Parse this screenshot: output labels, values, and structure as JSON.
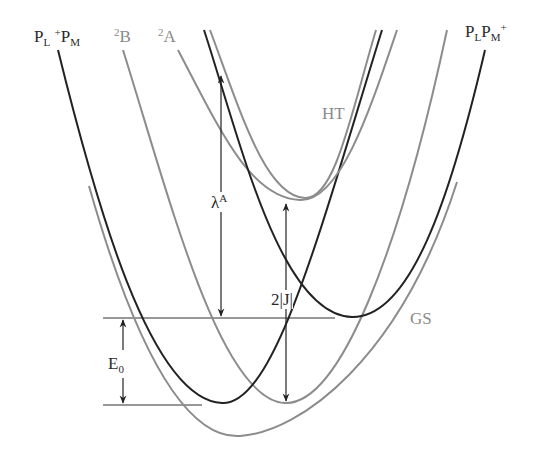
{
  "figure": {
    "labels": {
      "left_top": {
        "base1": "P",
        "sub1": "L",
        "sup": "+",
        "base2": "P",
        "sub2": "M"
      },
      "right_top": {
        "base1": "P",
        "sub1": "L",
        "base2": "P",
        "sub2": "M",
        "sup": "+"
      },
      "state_2B": {
        "sup": "2",
        "base": "B"
      },
      "state_2A": {
        "sup": "2",
        "base": "A"
      },
      "ht": "HT",
      "gs": "GS"
    },
    "arrows": {
      "lambda": {
        "base": "λ",
        "sup": "A"
      },
      "two_j": "2|J|",
      "e0": {
        "base": "E",
        "sub": "0"
      }
    },
    "colors": {
      "dark_curve": "#222222",
      "gray_curve": "#8c8c8c",
      "arrow": "#222222",
      "background": "#ffffff"
    },
    "curves": [
      {
        "name": "PL+PM",
        "style": "dark",
        "min": [
          222,
          403
        ]
      },
      {
        "name": "PLPM+",
        "style": "dark",
        "min": [
          352,
          317
        ]
      },
      {
        "name": "2B",
        "style": "gray",
        "min": [
          285,
          403
        ]
      },
      {
        "name": "HT",
        "style": "gray",
        "min": [
          305,
          200
        ]
      },
      {
        "name": "GS",
        "style": "gray",
        "min": [
          235,
          436
        ]
      }
    ]
  }
}
